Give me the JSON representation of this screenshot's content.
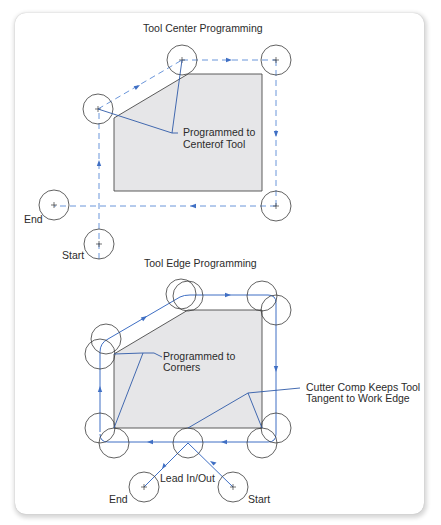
{
  "figure": {
    "colors": {
      "path_blue": "#3f6fc4",
      "dashed_blue": "#5a8ad6",
      "workpiece_fill": "#e6e6e8",
      "workpiece_stroke": "#4a4a4a",
      "tool_circle": "#3a3a3a",
      "leader_line": "#2f5aa8",
      "text": "#2b2b2b"
    },
    "top_diagram": {
      "title": "Tool Center Programming",
      "callout": "Programmed to\nCenterof Tool",
      "callout_line1": "Programmed to",
      "callout_line2": "Centerof Tool",
      "end_label": "End",
      "start_label": "Start",
      "path_style": "dashed",
      "tool_positions": [
        {
          "x": 99,
          "y": 244,
          "role": "start"
        },
        {
          "x": 98,
          "y": 109,
          "role": "corner"
        },
        {
          "x": 182,
          "y": 60,
          "role": "corner"
        },
        {
          "x": 276,
          "y": 60,
          "role": "corner"
        },
        {
          "x": 276,
          "y": 206,
          "role": "corner"
        },
        {
          "x": 54,
          "y": 205,
          "role": "end"
        }
      ]
    },
    "bottom_diagram": {
      "title": "Tool Edge Programming",
      "callout_corners_line1": "Programmed to",
      "callout_corners_line2": "Corners",
      "callout_comp_line1": "Cutter Comp Keeps Tool",
      "callout_comp_line2": "Tangent to Work Edge",
      "lead_label": "Lead In/Out",
      "end_label": "End",
      "start_label": "Start",
      "path_style": "solid"
    }
  }
}
